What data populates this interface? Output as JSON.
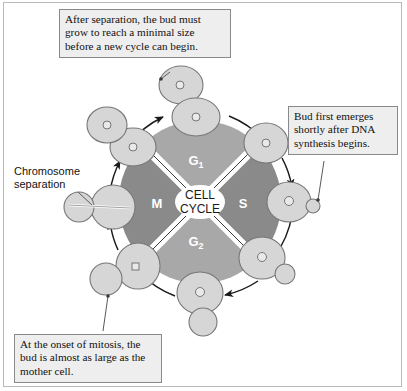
{
  "figure": {
    "center_label_line1": "CELL",
    "center_label_line2": "CYCLE"
  },
  "phases": [
    {
      "name": "g1",
      "label": "G",
      "sub": "1",
      "color": "#a8a8a8",
      "position": "top"
    },
    {
      "name": "s",
      "label": "S",
      "sub": "",
      "color": "#8a8a8a",
      "position": "right"
    },
    {
      "name": "g2",
      "label": "G",
      "sub": "2",
      "color": "#a8a8a8",
      "position": "bottom"
    },
    {
      "name": "m",
      "label": "M",
      "sub": "",
      "color": "#8a8a8a",
      "position": "left"
    }
  ],
  "callouts": {
    "top": "After separation, the bud must grow to reach a minimal size before a new cycle can begin.",
    "right": "Bud first emerges shortly after DNA synthesis begins.",
    "bottom": "At the onset of mitosis, the bud is almost as large as the mother cell."
  },
  "labels": {
    "chromosome_separation": "Chromosome\nseparation"
  },
  "colors": {
    "phase_light": "#a8a8a8",
    "phase_dark": "#8a8a8a",
    "cell_fill": "#d6d6d6",
    "cell_stroke": "#777777",
    "callout_bg": "#eeeeee",
    "callout_border": "#8a8a8a",
    "arrow": "#1a1a1a",
    "frame": "#b9b9b9"
  },
  "cells": [
    {
      "name": "cell-daughter-detached-top",
      "bud": "none"
    },
    {
      "name": "cell-g1-top",
      "bud": "none"
    },
    {
      "name": "cell-g1-s-upper-right",
      "bud": "none"
    },
    {
      "name": "cell-s-right-small-bud",
      "bud": "small"
    },
    {
      "name": "cell-g2-lower-right-medium-bud",
      "bud": "medium"
    },
    {
      "name": "cell-mitosis-bottom-large-bud",
      "bud": "large"
    },
    {
      "name": "cell-mitosis-lower-left-large-bud",
      "bud": "large"
    },
    {
      "name": "cell-chromosome-separation-left",
      "bud": "separating"
    },
    {
      "name": "cell-divided-upper-left",
      "bud": "none"
    },
    {
      "name": "cell-detached-daughter-upper-left",
      "bud": "none"
    }
  ]
}
